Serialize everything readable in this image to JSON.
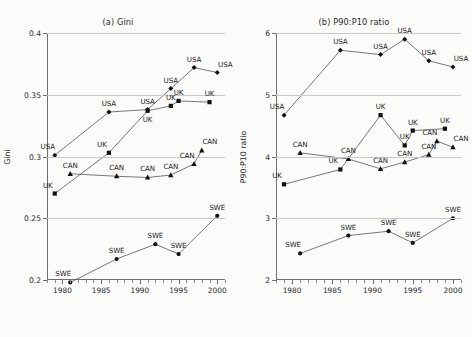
{
  "figure": {
    "xlabel": "Year",
    "panels": [
      {
        "key": "a",
        "title": "(a) Gini",
        "ylabel": "Gini",
        "ylim": [
          0.2,
          0.4
        ],
        "yticks": [
          0.2,
          0.25,
          0.3,
          0.35,
          0.4
        ],
        "ytick_labels": [
          "0.2",
          "0.25",
          "0.3",
          "0.35",
          "0.4"
        ],
        "xlim": [
          1978,
          2001
        ],
        "xticks": [
          1980,
          1985,
          1990,
          1995,
          2000
        ],
        "xtick_labels": [
          "1980",
          "1985",
          "1990",
          "1995",
          "2000"
        ]
      },
      {
        "key": "b",
        "title": "(b) P90:P10 ratio",
        "ylabel": "P90:P10 ratio",
        "ylim": [
          2,
          6
        ],
        "yticks": [
          2,
          3,
          4,
          5,
          6
        ],
        "ytick_labels": [
          "2",
          "3",
          "4",
          "5",
          "6"
        ],
        "xlim": [
          1978,
          2001
        ],
        "xticks": [
          1980,
          1985,
          1990,
          1995,
          2000
        ],
        "xtick_labels": [
          "1980",
          "1985",
          "1990",
          "1995",
          "2000"
        ]
      }
    ]
  },
  "chart_data": [
    {
      "type": "line",
      "panel": "a",
      "title": "(a) Gini",
      "xlabel": "Year",
      "ylabel": "Gini",
      "xlim": [
        1978,
        2001
      ],
      "ylim": [
        0.2,
        0.4
      ],
      "grid": true,
      "legend": "none",
      "point_labels": true,
      "series": [
        {
          "name": "USA",
          "marker": "diamond",
          "x": [
            1979,
            1986,
            1991,
            1994,
            1997,
            2000
          ],
          "y": [
            0.301,
            0.336,
            0.338,
            0.355,
            0.372,
            0.368
          ],
          "labels": [
            "USA",
            "USA",
            "USA",
            "USA",
            "USA",
            "USA"
          ],
          "label_pos": [
            "above-left",
            "above",
            "above",
            "above",
            "above",
            "above-right"
          ]
        },
        {
          "name": "UK",
          "marker": "square",
          "x": [
            1979,
            1986,
            1991,
            1994,
            1995,
            1999
          ],
          "y": [
            0.27,
            0.303,
            0.337,
            0.341,
            0.345,
            0.344
          ],
          "labels": [
            "UK",
            "UK",
            "UK",
            "UK",
            "UK",
            "UK"
          ],
          "label_pos": [
            "above-left",
            "above-left",
            "below",
            "above",
            "above",
            "above"
          ]
        },
        {
          "name": "CAN",
          "marker": "triangle",
          "x": [
            1981,
            1987,
            1991,
            1994,
            1997,
            1998
          ],
          "y": [
            0.286,
            0.284,
            0.283,
            0.285,
            0.294,
            0.305
          ],
          "labels": [
            "CAN",
            "CAN",
            "CAN",
            "CAN",
            "CAN",
            "CAN"
          ],
          "label_pos": [
            "above",
            "above",
            "above",
            "above",
            "above-left",
            "above-right"
          ]
        },
        {
          "name": "SWE",
          "marker": "circle",
          "x": [
            1981,
            1987,
            1992,
            1995,
            2000
          ],
          "y": [
            0.198,
            0.217,
            0.229,
            0.221,
            0.252
          ],
          "labels": [
            "SWE",
            "SWE",
            "SWE",
            "SWE",
            "SWE"
          ],
          "label_pos": [
            "above-left",
            "above",
            "above",
            "above",
            "above"
          ]
        }
      ]
    },
    {
      "type": "line",
      "panel": "b",
      "title": "(b) P90:P10 ratio",
      "xlabel": "Year",
      "ylabel": "P90:P10 ratio",
      "xlim": [
        1978,
        2001
      ],
      "ylim": [
        2,
        6
      ],
      "grid": true,
      "legend": "none",
      "point_labels": true,
      "series": [
        {
          "name": "USA",
          "marker": "diamond",
          "x": [
            1979,
            1986,
            1991,
            1994,
            1997,
            2000
          ],
          "y": [
            4.67,
            5.72,
            5.65,
            5.9,
            5.55,
            5.45
          ],
          "labels": [
            "USA",
            "USA",
            "USA",
            "USA",
            "USA",
            "USA"
          ],
          "label_pos": [
            "above-left",
            "above",
            "above",
            "above",
            "above",
            "above-right"
          ]
        },
        {
          "name": "UK",
          "marker": "square",
          "x": [
            1979,
            1986,
            1991,
            1994,
            1995,
            1999
          ],
          "y": [
            3.55,
            3.79,
            4.67,
            4.18,
            4.42,
            4.45
          ],
          "labels": [
            "UK",
            "UK",
            "UK",
            "UK",
            "UK",
            "UK"
          ],
          "label_pos": [
            "above-left",
            "above-left",
            "above",
            "above",
            "above",
            "above"
          ]
        },
        {
          "name": "CAN",
          "marker": "triangle",
          "x": [
            1981,
            1987,
            1991,
            1994,
            1997,
            1998,
            2000
          ],
          "y": [
            4.06,
            3.96,
            3.8,
            3.91,
            4.03,
            4.25,
            4.15
          ],
          "labels": [
            "CAN",
            "CAN",
            "CAN",
            "CAN",
            "CAN",
            "CAN",
            "CAN"
          ],
          "label_pos": [
            "above",
            "above",
            "above",
            "above",
            "above",
            "above-left",
            "above-right"
          ]
        },
        {
          "name": "SWE",
          "marker": "circle",
          "x": [
            1981,
            1987,
            1992,
            1995,
            2000
          ],
          "y": [
            2.43,
            2.72,
            2.79,
            2.6,
            3.0
          ],
          "labels": [
            "SWE",
            "SWE",
            "SWE",
            "SWE",
            "SWE"
          ],
          "label_pos": [
            "above-left",
            "above",
            "above",
            "above",
            "above"
          ]
        }
      ]
    }
  ],
  "style": {
    "line_color": "#555555",
    "marker_color": "#111111",
    "grid_color": "#c9c9c9",
    "axis_color": "#6e6e6e",
    "background": "#fbfbfa"
  }
}
